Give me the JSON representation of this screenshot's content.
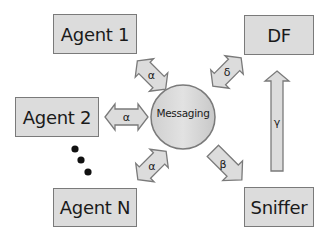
{
  "nodes": {
    "agent1": {
      "label": "Agent 1"
    },
    "agent2": {
      "label": "Agent 2"
    },
    "agentN": {
      "label": "Agent N"
    },
    "df": {
      "label": "DF"
    },
    "sniffer": {
      "label": "Sniffer"
    },
    "messaging": {
      "label": "Messaging"
    }
  },
  "edges": {
    "agent1_messaging": {
      "label": "α",
      "type": "bidirectional"
    },
    "agent2_messaging": {
      "label": "α",
      "type": "bidirectional"
    },
    "agentN_messaging": {
      "label": "α",
      "type": "bidirectional"
    },
    "messaging_df": {
      "label": "δ",
      "type": "bidirectional"
    },
    "messaging_sniffer": {
      "label": "β",
      "type": "unidirectional"
    },
    "sniffer_df": {
      "label": "γ",
      "type": "unidirectional"
    }
  },
  "ellipsis": {
    "count": 3
  },
  "colors": {
    "fill": "#dcdcdc",
    "stroke": "#7a7a7a",
    "text": "#1a1a1a",
    "background": "#ffffff"
  }
}
